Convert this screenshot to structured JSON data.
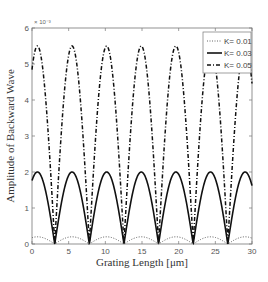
{
  "chart_data": {
    "type": "line",
    "title": "",
    "xlabel": "Grating Length [μm]",
    "ylabel": "Amplitude of Backward Wave",
    "y_exponent_label": "× 10⁻³",
    "xlim": [
      0,
      30
    ],
    "ylim": [
      0,
      6
    ],
    "y_scale_factor": 0.001,
    "xticks": [
      0,
      5,
      10,
      15,
      20,
      25,
      30
    ],
    "yticks": [
      0,
      1,
      2,
      3,
      4,
      5,
      6
    ],
    "grid": false,
    "legend_position": "upper right",
    "period_um": 4.72,
    "zeros_um": [
      3.1,
      7.82,
      12.54,
      17.26,
      21.98,
      26.7
    ],
    "series": [
      {
        "name": "K= 0.01",
        "style": "dotted",
        "peak": 0.2,
        "color": "#555555"
      },
      {
        "name": "K= 0.03",
        "style": "solid",
        "peak": 2.0,
        "color": "#111111"
      },
      {
        "name": "K= 0.05",
        "style": "dashdot",
        "peak": 5.5,
        "color": "#111111"
      }
    ]
  },
  "legend": {
    "items": [
      "K= 0.01",
      "K= 0.03",
      "K= 0.05"
    ]
  }
}
